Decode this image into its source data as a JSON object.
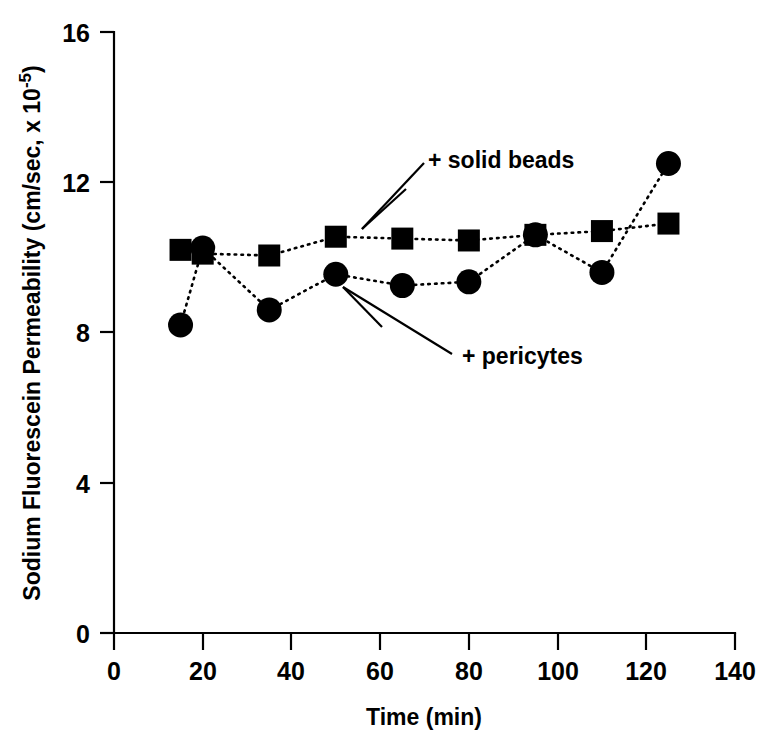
{
  "chart_data": {
    "type": "line",
    "title": "",
    "subtitle": "",
    "xlabel": "Time (min)",
    "ylabel": "Sodium Fluorescein Permeability (cm/sec, x 10-5)",
    "ylabel_main": "Sodium Fluorescein Permeability (cm/sec, x 10",
    "ylabel_exponent": "-5",
    "ylabel_close": ")",
    "xlim": [
      0,
      140
    ],
    "ylim": [
      0,
      16
    ],
    "xticks": [
      0,
      20,
      40,
      60,
      80,
      100,
      120,
      140
    ],
    "yticks": [
      0,
      4,
      8,
      12,
      16
    ],
    "xtick_labels": [
      "0",
      "20",
      "40",
      "60",
      "80",
      "100",
      "120",
      "140"
    ],
    "ytick_labels": [
      "0",
      "4",
      "8",
      "12",
      "16"
    ],
    "grid": false,
    "legend": "none",
    "marker_style_note": "squares = + solid beads, circles = + pericytes",
    "series": [
      {
        "name": "+ solid beads",
        "marker": "square",
        "linestyle": "dotted",
        "x": [
          15,
          20,
          35,
          50,
          65,
          80,
          95,
          110,
          125
        ],
        "values": [
          10.2,
          10.1,
          10.05,
          10.55,
          10.5,
          10.45,
          10.6,
          10.7,
          10.9
        ]
      },
      {
        "name": "+ pericytes",
        "marker": "circle",
        "linestyle": "dotted",
        "x": [
          15,
          20,
          35,
          50,
          65,
          80,
          95,
          110,
          125
        ],
        "values": [
          8.2,
          10.25,
          8.6,
          9.55,
          9.25,
          9.35,
          10.6,
          9.6,
          12.5
        ]
      }
    ],
    "annotations": [
      {
        "text": "+ solid beads",
        "label_x": 428,
        "label_y": 168,
        "arrows": [
          {
            "x1": 424,
            "y1": 163,
            "x2": 362,
            "y2": 229
          },
          {
            "x1": 406,
            "y1": 189,
            "x2": 362,
            "y2": 229
          }
        ]
      },
      {
        "text": "+ pericytes",
        "label_x": 462,
        "label_y": 364,
        "arrows": [
          {
            "x1": 452,
            "y1": 354,
            "x2": 343,
            "y2": 287
          },
          {
            "x1": 382,
            "y1": 327,
            "x2": 343,
            "y2": 287
          }
        ]
      }
    ],
    "colors": {
      "axis": "#000000",
      "marker": "#000000",
      "line": "#000000",
      "background": "#ffffff"
    }
  },
  "figure": {
    "plot_left_px": 114,
    "plot_right_px": 735,
    "plot_bottom_px": 633,
    "plot_top_px": 32
  }
}
